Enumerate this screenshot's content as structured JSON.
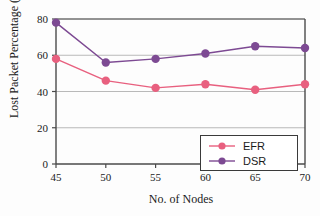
{
  "chart_data": {
    "type": "line",
    "title": "",
    "xlabel": "No. of Nodes",
    "ylabel": "Lost Packet Percentage (%)",
    "categories": [
      45,
      50,
      55,
      60,
      65,
      70
    ],
    "x": [
      45,
      50,
      55,
      60,
      65,
      70
    ],
    "xtick_labels": [
      "45",
      "50",
      "55",
      "60",
      "65",
      "70"
    ],
    "ytick_labels": [
      "0",
      "20",
      "40",
      "60",
      "80"
    ],
    "yticks": [
      0,
      20,
      40,
      60,
      80
    ],
    "xlim": [
      45,
      70
    ],
    "ylim": [
      0,
      80
    ],
    "grid": "horizontal",
    "legend_position": "lower-right",
    "series": [
      {
        "name": "EFR",
        "color": "#e8607f",
        "marker": "circle",
        "values": [
          58,
          46,
          42,
          44,
          41,
          44
        ]
      },
      {
        "name": "DSR",
        "color": "#7d4a93",
        "marker": "circle",
        "values": [
          78,
          56,
          58,
          61,
          65,
          64
        ]
      }
    ]
  },
  "legend": {
    "items": [
      {
        "label": "EFR",
        "color": "#e8607f"
      },
      {
        "label": "DSR",
        "color": "#7d4a93"
      }
    ]
  },
  "axes": {
    "y_title": "Lost Packet Percentage (%)",
    "x_title": "No. of Nodes"
  }
}
